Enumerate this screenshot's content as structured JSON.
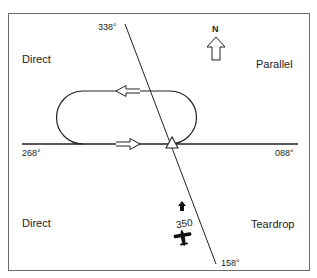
{
  "diagram": {
    "type": "holding-pattern-entry",
    "compass": {
      "label": "N",
      "icon": "north-arrow-icon"
    },
    "sectors": {
      "top_left": "Direct",
      "top_right": "Parallel",
      "bottom_left": "Direct",
      "bottom_right": "Teardrop"
    },
    "radials": {
      "diagonal_top": "338°",
      "diagonal_bottom": "158°",
      "horizontal_left": "268°",
      "horizontal_right": "088°"
    },
    "aircraft": {
      "heading": "350",
      "icon": "airplane-icon",
      "direction_icon": "heading-arrow-icon"
    },
    "fix": {
      "icon": "holding-fix-triangle-icon"
    },
    "holding_pattern": {
      "inbound_arrow": "right",
      "outbound_arrow": "left"
    },
    "colors": {
      "line": "#222222",
      "frame": "#6a6a6a",
      "background": "#ffffff"
    }
  }
}
